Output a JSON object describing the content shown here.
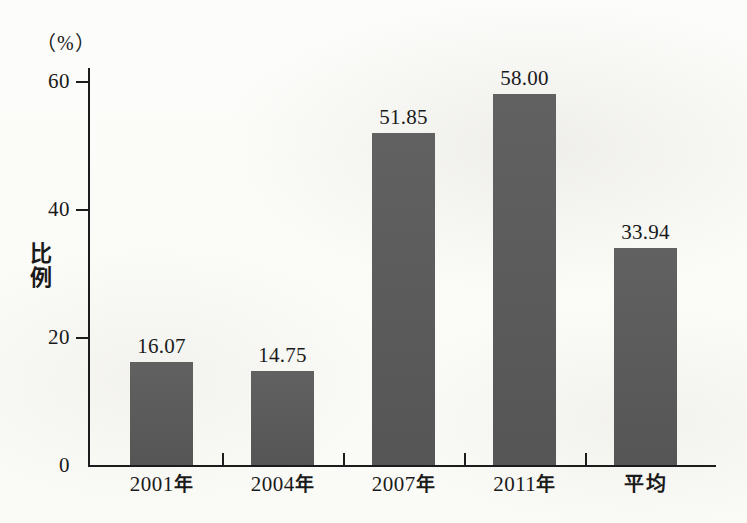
{
  "chart_data": {
    "type": "bar",
    "title": "",
    "subtitle": "",
    "xlabel": "",
    "ylabel": "比例",
    "unit_label": "（%）",
    "categories": [
      "2001年",
      "2004年",
      "2007年",
      "2011年",
      "平均"
    ],
    "values": [
      16.07,
      14.75,
      51.85,
      58.0,
      33.94
    ],
    "value_labels": [
      "16.07",
      "14.75",
      "51.85",
      "58.00",
      "33.94"
    ],
    "ylim": [
      0,
      60
    ],
    "yticks": [
      0,
      20,
      40,
      60
    ],
    "ytick_labels": [
      "0",
      "20",
      "40",
      "60"
    ],
    "grid": false,
    "legend": false,
    "legend_position": "none",
    "bar_color": "#5a5a5a",
    "axis_color": "#1c1c1c",
    "background_color": "#fdfdfb"
  }
}
